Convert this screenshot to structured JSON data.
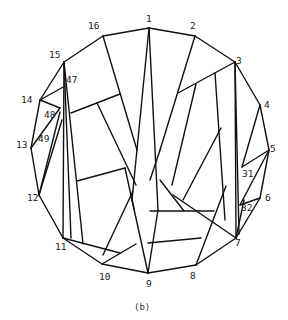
{
  "figure": {
    "caption": "(b)",
    "line_color": "#111111",
    "background": "#ffffff"
  },
  "nodes": [
    {
      "id": "1",
      "label": "1",
      "x": 149,
      "y": 28,
      "lx": 146,
      "ly": 22
    },
    {
      "id": "2",
      "label": "2",
      "x": 195,
      "y": 36,
      "lx": 190,
      "ly": 29
    },
    {
      "id": "3",
      "label": "3",
      "x": 235,
      "y": 62,
      "lx": 236,
      "ly": 64
    },
    {
      "id": "4",
      "label": "4",
      "x": 260,
      "y": 105,
      "lx": 264,
      "ly": 108
    },
    {
      "id": "5",
      "label": "5",
      "x": 269,
      "y": 150,
      "lx": 270,
      "ly": 152
    },
    {
      "id": "6",
      "label": "6",
      "x": 260,
      "y": 198,
      "lx": 265,
      "ly": 201
    },
    {
      "id": "7",
      "label": "7",
      "x": 236,
      "y": 238,
      "lx": 235,
      "ly": 246
    },
    {
      "id": "8",
      "label": "8",
      "x": 196,
      "y": 265,
      "lx": 190,
      "ly": 279
    },
    {
      "id": "9",
      "label": "9",
      "x": 148,
      "y": 273,
      "lx": 146,
      "ly": 287
    },
    {
      "id": "10",
      "label": "10",
      "x": 102,
      "y": 264,
      "lx": 99,
      "ly": 280
    },
    {
      "id": "11",
      "label": "11",
      "x": 63,
      "y": 238,
      "lx": 55,
      "ly": 250
    },
    {
      "id": "12",
      "label": "12",
      "x": 39,
      "y": 195,
      "lx": 27,
      "ly": 201
    },
    {
      "id": "13",
      "label": "13",
      "x": 31,
      "y": 148,
      "lx": 16,
      "ly": 148
    },
    {
      "id": "14",
      "label": "14",
      "x": 40,
      "y": 100,
      "lx": 21,
      "ly": 103
    },
    {
      "id": "15",
      "label": "15",
      "x": 64,
      "y": 62,
      "lx": 49,
      "ly": 58
    },
    {
      "id": "16",
      "label": "16",
      "x": 103,
      "y": 36,
      "lx": 88,
      "ly": 29
    },
    {
      "id": "47",
      "label": "47",
      "x": 65,
      "y": 80,
      "lx": 66,
      "ly": 83
    },
    {
      "id": "48",
      "label": "48",
      "x": 60,
      "y": 108,
      "lx": 44,
      "ly": 118
    },
    {
      "id": "49",
      "label": "49",
      "x": 47,
      "y": 137,
      "lx": 38,
      "ly": 142
    },
    {
      "id": "31",
      "label": "31",
      "x": 242,
      "y": 167,
      "lx": 242,
      "ly": 177
    },
    {
      "id": "32",
      "label": "32",
      "x": 240,
      "y": 205,
      "lx": 241,
      "ly": 211
    }
  ],
  "edges": [
    {
      "x1": 149,
      "y1": 28,
      "x2": 195,
      "y2": 36
    },
    {
      "x1": 195,
      "y1": 36,
      "x2": 235,
      "y2": 62
    },
    {
      "x1": 235,
      "y1": 62,
      "x2": 260,
      "y2": 105
    },
    {
      "x1": 260,
      "y1": 105,
      "x2": 269,
      "y2": 150
    },
    {
      "x1": 269,
      "y1": 150,
      "x2": 260,
      "y2": 198
    },
    {
      "x1": 260,
      "y1": 198,
      "x2": 236,
      "y2": 238
    },
    {
      "x1": 236,
      "y1": 238,
      "x2": 196,
      "y2": 265
    },
    {
      "x1": 196,
      "y1": 265,
      "x2": 148,
      "y2": 273
    },
    {
      "x1": 148,
      "y1": 273,
      "x2": 102,
      "y2": 264
    },
    {
      "x1": 102,
      "y1": 264,
      "x2": 63,
      "y2": 238
    },
    {
      "x1": 63,
      "y1": 238,
      "x2": 39,
      "y2": 195
    },
    {
      "x1": 39,
      "y1": 195,
      "x2": 31,
      "y2": 148
    },
    {
      "x1": 31,
      "y1": 148,
      "x2": 40,
      "y2": 100
    },
    {
      "x1": 40,
      "y1": 100,
      "x2": 64,
      "y2": 62
    },
    {
      "x1": 64,
      "y1": 62,
      "x2": 103,
      "y2": 36
    },
    {
      "x1": 103,
      "y1": 36,
      "x2": 149,
      "y2": 28
    },
    {
      "x1": 149,
      "y1": 28,
      "x2": 132,
      "y2": 200
    },
    {
      "x1": 149,
      "y1": 28,
      "x2": 158,
      "y2": 210
    },
    {
      "x1": 132,
      "y1": 200,
      "x2": 148,
      "y2": 273
    },
    {
      "x1": 158,
      "y1": 210,
      "x2": 148,
      "y2": 273
    },
    {
      "x1": 103,
      "y1": 36,
      "x2": 137,
      "y2": 150
    },
    {
      "x1": 195,
      "y1": 36,
      "x2": 160,
      "y2": 150
    },
    {
      "x1": 160,
      "y1": 150,
      "x2": 150,
      "y2": 180
    },
    {
      "x1": 235,
      "y1": 62,
      "x2": 178,
      "y2": 93
    },
    {
      "x1": 196,
      "y1": 84,
      "x2": 172,
      "y2": 185
    },
    {
      "x1": 215,
      "y1": 73,
      "x2": 225,
      "y2": 220
    },
    {
      "x1": 235,
      "y1": 62,
      "x2": 236,
      "y2": 238
    },
    {
      "x1": 235,
      "y1": 62,
      "x2": 239,
      "y2": 234
    },
    {
      "x1": 221,
      "y1": 128,
      "x2": 183,
      "y2": 200
    },
    {
      "x1": 260,
      "y1": 105,
      "x2": 242,
      "y2": 167
    },
    {
      "x1": 269,
      "y1": 150,
      "x2": 242,
      "y2": 167
    },
    {
      "x1": 269,
      "y1": 150,
      "x2": 240,
      "y2": 205
    },
    {
      "x1": 260,
      "y1": 198,
      "x2": 240,
      "y2": 205
    },
    {
      "x1": 236,
      "y1": 238,
      "x2": 244,
      "y2": 200
    },
    {
      "x1": 64,
      "y1": 62,
      "x2": 63,
      "y2": 238
    },
    {
      "x1": 64,
      "y1": 62,
      "x2": 71,
      "y2": 238
    },
    {
      "x1": 64,
      "y1": 62,
      "x2": 83,
      "y2": 244
    },
    {
      "x1": 40,
      "y1": 100,
      "x2": 60,
      "y2": 108
    },
    {
      "x1": 40,
      "y1": 100,
      "x2": 65,
      "y2": 86
    },
    {
      "x1": 31,
      "y1": 148,
      "x2": 60,
      "y2": 108
    },
    {
      "x1": 39,
      "y1": 195,
      "x2": 60,
      "y2": 112
    },
    {
      "x1": 39,
      "y1": 195,
      "x2": 62,
      "y2": 120
    },
    {
      "x1": 71,
      "y1": 113,
      "x2": 120,
      "y2": 94
    },
    {
      "x1": 97,
      "y1": 103,
      "x2": 136,
      "y2": 185
    },
    {
      "x1": 77,
      "y1": 181,
      "x2": 125,
      "y2": 168
    },
    {
      "x1": 125,
      "y1": 168,
      "x2": 134,
      "y2": 209
    },
    {
      "x1": 63,
      "y1": 238,
      "x2": 120,
      "y2": 253
    },
    {
      "x1": 102,
      "y1": 264,
      "x2": 136,
      "y2": 244
    },
    {
      "x1": 103,
      "y1": 255,
      "x2": 133,
      "y2": 191
    },
    {
      "x1": 150,
      "y1": 211,
      "x2": 214,
      "y2": 211
    },
    {
      "x1": 148,
      "y1": 243,
      "x2": 201,
      "y2": 238
    },
    {
      "x1": 196,
      "y1": 265,
      "x2": 226,
      "y2": 186
    },
    {
      "x1": 160,
      "y1": 180,
      "x2": 184,
      "y2": 211
    },
    {
      "x1": 173,
      "y1": 195,
      "x2": 236,
      "y2": 238
    }
  ]
}
